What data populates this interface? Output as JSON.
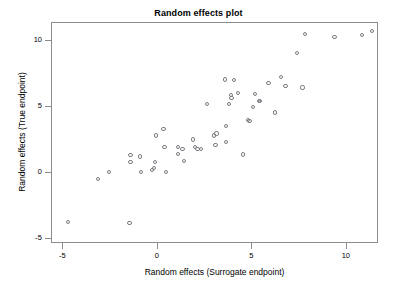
{
  "chart_data": {
    "type": "scatter",
    "title": "Random effects plot",
    "xlabel": "Random effects (Surrogate endpoint)",
    "ylabel": "Random effects (True endpoint)",
    "xlim": [
      -5.6,
      11.7
    ],
    "ylim": [
      -5.4,
      11.4
    ],
    "xticks": [
      -5,
      0,
      5,
      10
    ],
    "xtick_labels": [
      "-5",
      "0",
      "5",
      "10"
    ],
    "yticks": [
      -5,
      0,
      5,
      10
    ],
    "ytick_labels": [
      "-5",
      "0",
      "5",
      "10"
    ],
    "grid": false,
    "legend": false,
    "marker": "open-circle",
    "marker_color": "#7b7b82",
    "points": [
      {
        "x": -4.75,
        "y": -3.75
      },
      {
        "x": -3.15,
        "y": -0.45
      },
      {
        "x": -2.6,
        "y": 0.05
      },
      {
        "x": -1.5,
        "y": -3.8
      },
      {
        "x": -1.45,
        "y": 1.35
      },
      {
        "x": -1.45,
        "y": 0.85
      },
      {
        "x": -0.95,
        "y": 1.25
      },
      {
        "x": -0.9,
        "y": 0.05
      },
      {
        "x": -0.3,
        "y": 0.25
      },
      {
        "x": -0.2,
        "y": 0.35
      },
      {
        "x": -0.15,
        "y": 0.85
      },
      {
        "x": -0.1,
        "y": 2.85
      },
      {
        "x": 0.3,
        "y": 3.35
      },
      {
        "x": 0.35,
        "y": 1.95
      },
      {
        "x": 0.45,
        "y": 0.1
      },
      {
        "x": 1.05,
        "y": 2.0
      },
      {
        "x": 1.05,
        "y": 1.45
      },
      {
        "x": 1.3,
        "y": 1.85
      },
      {
        "x": 1.4,
        "y": 0.9
      },
      {
        "x": 1.85,
        "y": 2.55
      },
      {
        "x": 1.95,
        "y": 2.0
      },
      {
        "x": 2.1,
        "y": 1.85
      },
      {
        "x": 2.3,
        "y": 1.85
      },
      {
        "x": 2.6,
        "y": 5.25
      },
      {
        "x": 2.95,
        "y": 2.85
      },
      {
        "x": 3.05,
        "y": 2.1
      },
      {
        "x": 3.1,
        "y": 3.0
      },
      {
        "x": 3.55,
        "y": 7.1
      },
      {
        "x": 3.6,
        "y": 2.35
      },
      {
        "x": 3.6,
        "y": 3.55
      },
      {
        "x": 3.75,
        "y": 5.25
      },
      {
        "x": 3.85,
        "y": 5.95
      },
      {
        "x": 3.9,
        "y": 5.7
      },
      {
        "x": 4.05,
        "y": 7.05
      },
      {
        "x": 4.25,
        "y": 6.05
      },
      {
        "x": 4.5,
        "y": 1.4
      },
      {
        "x": 4.75,
        "y": 4.0
      },
      {
        "x": 4.85,
        "y": 3.95
      },
      {
        "x": 5.05,
        "y": 5.0
      },
      {
        "x": 5.15,
        "y": 6.0
      },
      {
        "x": 5.35,
        "y": 5.45
      },
      {
        "x": 5.4,
        "y": 5.5
      },
      {
        "x": 5.85,
        "y": 6.85
      },
      {
        "x": 6.2,
        "y": 4.6
      },
      {
        "x": 6.5,
        "y": 7.3
      },
      {
        "x": 6.75,
        "y": 6.6
      },
      {
        "x": 7.35,
        "y": 9.15
      },
      {
        "x": 7.65,
        "y": 6.5
      },
      {
        "x": 7.8,
        "y": 10.55
      },
      {
        "x": 9.35,
        "y": 10.35
      },
      {
        "x": 10.8,
        "y": 10.5
      },
      {
        "x": 11.35,
        "y": 10.8
      }
    ]
  }
}
